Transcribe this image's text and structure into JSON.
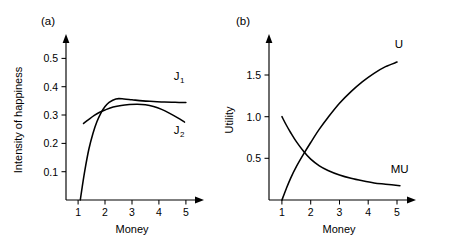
{
  "figure": {
    "panel_a_label": "(a)",
    "panel_b_label": "(b)"
  },
  "chart_data": [
    {
      "type": "line",
      "panel": "(a)",
      "title": "",
      "xlabel": "Money",
      "ylabel": "Intensity of happiness",
      "xlim": [
        0.55,
        5.45
      ],
      "ylim": [
        0.0,
        0.565
      ],
      "xticks": [
        1,
        2,
        3,
        4,
        5
      ],
      "xtick_labels": [
        "1",
        "2",
        "3",
        "4",
        "5"
      ],
      "yticks": [
        0.1,
        0.2,
        0.3,
        0.4,
        0.5
      ],
      "ytick_labels": [
        "0.1",
        "0.2",
        "0.3",
        "0.4",
        "0.5"
      ],
      "grid": false,
      "legend": "inline-curve-labels",
      "series": [
        {
          "name": "J1",
          "label": "J",
          "label_sub": "1",
          "label_x": 4.55,
          "label_y": 0.425,
          "x": [
            1.08,
            1.15,
            1.25,
            1.4,
            1.55,
            1.7,
            1.85,
            2.0,
            2.15,
            2.4,
            2.7,
            3.0,
            3.4,
            3.8,
            4.2,
            4.6,
            5.0
          ],
          "y": [
            0.0,
            0.045,
            0.105,
            0.18,
            0.235,
            0.277,
            0.308,
            0.33,
            0.345,
            0.357,
            0.357,
            0.354,
            0.35,
            0.348,
            0.346,
            0.345,
            0.344
          ]
        },
        {
          "name": "J2",
          "label": "J",
          "label_sub": "2",
          "label_x": 4.55,
          "label_y": 0.235,
          "x": [
            1.2,
            1.4,
            1.6,
            1.8,
            2.0,
            2.3,
            2.6,
            2.9,
            3.2,
            3.5,
            3.8,
            4.1,
            4.4,
            4.7,
            4.95
          ],
          "y": [
            0.27,
            0.285,
            0.299,
            0.31,
            0.318,
            0.328,
            0.334,
            0.337,
            0.338,
            0.336,
            0.33,
            0.32,
            0.306,
            0.29,
            0.275
          ]
        }
      ]
    },
    {
      "type": "line",
      "panel": "(b)",
      "title": "",
      "xlabel": "Money",
      "ylabel": "Utility",
      "xlim": [
        0.55,
        5.45
      ],
      "ylim": [
        0.0,
        1.92
      ],
      "xticks": [
        1,
        2,
        3,
        4,
        5
      ],
      "xtick_labels": [
        "1",
        "2",
        "3",
        "4",
        "5"
      ],
      "yticks": [
        0.5,
        1.0,
        1.5
      ],
      "ytick_labels": [
        "0.5",
        "1.0",
        "1.5"
      ],
      "grid": false,
      "legend": "inline-curve-labels",
      "series": [
        {
          "name": "U",
          "label": "U",
          "label_x": 4.92,
          "label_y": 1.82,
          "x": [
            1.0,
            1.15,
            1.3,
            1.5,
            1.75,
            2.0,
            2.3,
            2.6,
            3.0,
            3.4,
            3.8,
            4.2,
            4.6,
            5.0
          ],
          "y": [
            0.0,
            0.135,
            0.26,
            0.4,
            0.55,
            0.69,
            0.85,
            0.99,
            1.16,
            1.3,
            1.42,
            1.52,
            1.6,
            1.655
          ]
        },
        {
          "name": "MU",
          "label": "MU",
          "label_x": 4.78,
          "label_y": 0.33,
          "x": [
            1.0,
            1.15,
            1.3,
            1.5,
            1.75,
            2.0,
            2.3,
            2.6,
            3.0,
            3.4,
            3.8,
            4.2,
            4.6,
            5.1
          ],
          "y": [
            1.0,
            0.9,
            0.81,
            0.7,
            0.585,
            0.49,
            0.41,
            0.355,
            0.3,
            0.26,
            0.23,
            0.205,
            0.19,
            0.172
          ]
        }
      ]
    }
  ]
}
